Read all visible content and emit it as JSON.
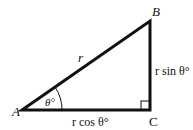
{
  "diagram": {
    "type": "right-triangle",
    "vertices": {
      "A": {
        "label": "A",
        "x": 22,
        "y": 110
      },
      "B": {
        "label": "B",
        "x": 150,
        "y": 21
      },
      "C": {
        "label": "C",
        "x": 150,
        "y": 110
      }
    },
    "labels": {
      "hypotenuse": "r",
      "angle": "θ°",
      "opposite": "r sin θ°",
      "adjacent": "r cos θ°"
    },
    "colors": {
      "stroke": "#111111",
      "background": "#ffffff"
    }
  }
}
